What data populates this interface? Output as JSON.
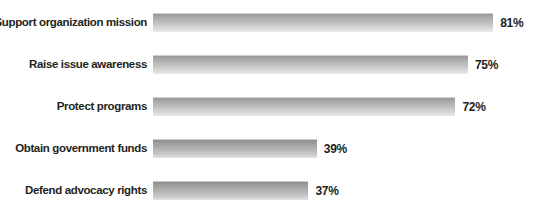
{
  "chart_data": {
    "type": "bar",
    "orientation": "horizontal",
    "title": "",
    "subtitle": "",
    "xlabel": "",
    "ylabel": "",
    "categories": [
      "Support organization mission",
      "Raise issue awareness",
      "Protect programs",
      "Obtain government funds",
      "Defend advocacy rights"
    ],
    "values": [
      81,
      75,
      72,
      39,
      37
    ],
    "value_labels": [
      "81%",
      "75%",
      "72%",
      "39%",
      "37%"
    ],
    "unit": "%",
    "xlim": [
      0,
      100
    ],
    "grid": false,
    "legend": null,
    "annotations": [],
    "bars": [
      {
        "label": "Support organization mission",
        "value": 81,
        "value_label": "81%"
      },
      {
        "label": "Raise issue awareness",
        "value": 75,
        "value_label": "75%"
      },
      {
        "label": "Protect programs",
        "value": 72,
        "value_label": "72%"
      },
      {
        "label": "Obtain government funds",
        "value": 39,
        "value_label": "39%"
      },
      {
        "label": "Defend advocacy rights",
        "value": 37,
        "value_label": "37%"
      }
    ]
  },
  "style": {
    "background": "#ffffff",
    "bar_gradient_top": "#9a9a9a",
    "bar_gradient_bottom": "#ededed",
    "text_color": "#231f20"
  }
}
